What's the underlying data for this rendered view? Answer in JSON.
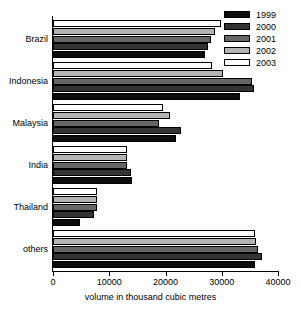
{
  "chart_data": {
    "type": "bar",
    "orientation": "horizontal",
    "title": "",
    "xlabel": "volume in thousand cubic metres",
    "ylabel": "",
    "xlim": [
      0,
      40000
    ],
    "xticks": [
      "0",
      "10000",
      "20000",
      "30000",
      "40000"
    ],
    "grid": false,
    "legend_position": "top-right",
    "categories": [
      "Brazil",
      "Indonesia",
      "Malaysia",
      "India",
      "Thailand",
      "others"
    ],
    "series": [
      {
        "name": "1999",
        "color": "#0d0d0d",
        "values": [
          27000,
          33200,
          21800,
          14000,
          4800,
          35900
        ]
      },
      {
        "name": "2000",
        "color": "#333333",
        "values": [
          27500,
          35800,
          22700,
          13800,
          7200,
          37100
        ]
      },
      {
        "name": "2001",
        "color": "#666666",
        "values": [
          28000,
          35300,
          18800,
          13200,
          7800,
          36500
        ]
      },
      {
        "name": "2002",
        "color": "#b3b3b3",
        "values": [
          28800,
          30200,
          20800,
          13100,
          7800,
          36000
        ]
      },
      {
        "name": "2003",
        "color": "#ffffff",
        "values": [
          29800,
          28200,
          19500,
          13200,
          7800,
          35900
        ]
      }
    ]
  },
  "legend": {
    "items": [
      {
        "label": "1999"
      },
      {
        "label": "2000"
      },
      {
        "label": "2001"
      },
      {
        "label": "2002"
      },
      {
        "label": "2003"
      }
    ]
  },
  "axis": {
    "x_title": "volume in thousand cubic metres"
  }
}
